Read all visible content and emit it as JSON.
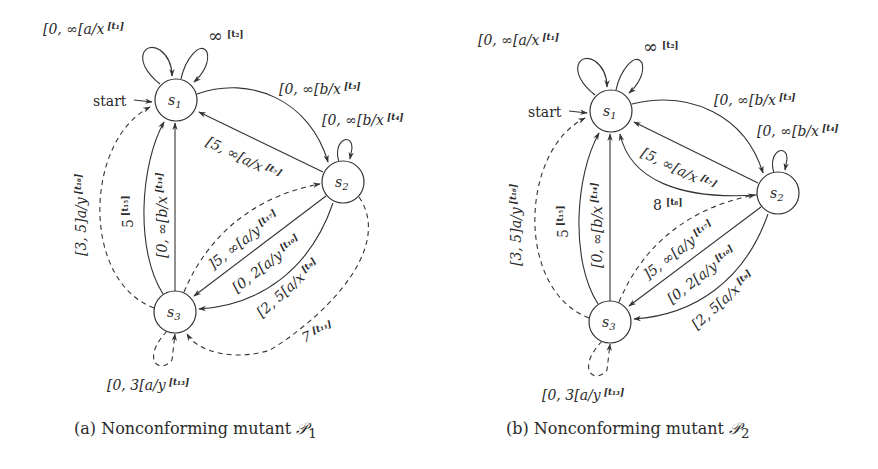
{
  "figures": [
    {
      "id": "a",
      "caption": {
        "prefix": "(a)",
        "text": "Nonconforming mutant",
        "math": "𝒫",
        "subscript": "1"
      },
      "start_label": "start",
      "states": [
        {
          "name": "s",
          "sub": "1"
        },
        {
          "name": "s",
          "sub": "2"
        },
        {
          "name": "s",
          "sub": "3"
        }
      ],
      "transitions": [
        {
          "id": "t1",
          "from": "s1",
          "to": "s1",
          "guard": "[0, ∞[a/x",
          "tag": "[t₁]",
          "style": "solid"
        },
        {
          "id": "t2",
          "from": "s1",
          "to": "s1",
          "guard": "∞",
          "tag": "[t₂]",
          "style": "solid"
        },
        {
          "id": "t3",
          "from": "s1",
          "to": "s2",
          "guard": "[0, ∞[b/x",
          "tag": "[t₃]",
          "style": "solid"
        },
        {
          "id": "t4",
          "from": "s2",
          "to": "s2",
          "guard": "[0, ∞[b/x",
          "tag": "[t₄]",
          "style": "solid"
        },
        {
          "id": "t7",
          "from": "s2",
          "to": "s1",
          "guard": "[5, ∞[a/x",
          "tag": "[t₇]",
          "style": "solid"
        },
        {
          "id": "t9",
          "from": "s2",
          "to": "s3",
          "guard": "[2, 5[a/x",
          "tag": "[t₉]",
          "style": "solid"
        },
        {
          "id": "t10",
          "from": "s2",
          "to": "s3",
          "guard": "[0, 2[a/y",
          "tag": "[t₁₀]",
          "style": "solid"
        },
        {
          "id": "t11",
          "from": "s2",
          "to": "s3",
          "guard": "7",
          "tag": "[t₁₁]",
          "style": "dashed"
        },
        {
          "id": "t13",
          "from": "s3",
          "to": "s3",
          "guard": "[0, 3[a/y",
          "tag": "[t₁₃]",
          "style": "dashed"
        },
        {
          "id": "t14",
          "from": "s3",
          "to": "s1",
          "guard": "[0, ∞[b/x",
          "tag": "[t₁₄]",
          "style": "solid"
        },
        {
          "id": "t15",
          "from": "s3",
          "to": "s1",
          "guard": "5",
          "tag": "[t₁₅]",
          "style": "solid"
        },
        {
          "id": "t16",
          "from": "s3",
          "to": "s1",
          "guard": "[3, 5]a/y",
          "tag": "[t₁₆]",
          "style": "dashed"
        },
        {
          "id": "t17",
          "from": "s3",
          "to": "s2",
          "guard": "]5, ∞[a/y",
          "tag": "[t₁₇]",
          "style": "dashed"
        }
      ]
    },
    {
      "id": "b",
      "caption": {
        "prefix": "(b)",
        "text": "Nonconforming mutant",
        "math": "𝒫",
        "subscript": "2"
      },
      "start_label": "start",
      "states": [
        {
          "name": "s",
          "sub": "1"
        },
        {
          "name": "s",
          "sub": "2"
        },
        {
          "name": "s",
          "sub": "3"
        }
      ],
      "transitions": [
        {
          "id": "t1",
          "from": "s1",
          "to": "s1",
          "guard": "[0, ∞[a/x",
          "tag": "[t₁]",
          "style": "solid"
        },
        {
          "id": "t2",
          "from": "s1",
          "to": "s1",
          "guard": "∞",
          "tag": "[t₂]",
          "style": "solid"
        },
        {
          "id": "t3",
          "from": "s1",
          "to": "s2",
          "guard": "[0, ∞[b/x",
          "tag": "[t₃]",
          "style": "solid"
        },
        {
          "id": "t4",
          "from": "s2",
          "to": "s2",
          "guard": "[0, ∞[b/x",
          "tag": "[t₄]",
          "style": "solid"
        },
        {
          "id": "t7",
          "from": "s2",
          "to": "s1",
          "guard": "[5, ∞[a/x",
          "tag": "[t₇]",
          "style": "solid"
        },
        {
          "id": "t8",
          "from": "s2",
          "to": "s1",
          "guard": "8",
          "tag": "[t₈]",
          "style": "solid"
        },
        {
          "id": "t9",
          "from": "s2",
          "to": "s3",
          "guard": "[2, 5[a/x",
          "tag": "[t₉]",
          "style": "solid"
        },
        {
          "id": "t10",
          "from": "s2",
          "to": "s3",
          "guard": "[0, 2[a/y",
          "tag": "[t₁₀]",
          "style": "solid"
        },
        {
          "id": "t13",
          "from": "s3",
          "to": "s3",
          "guard": "[0, 3[a/y",
          "tag": "[t₁₃]",
          "style": "dashed"
        },
        {
          "id": "t14",
          "from": "s3",
          "to": "s1",
          "guard": "[0, ∞[b/x",
          "tag": "[t₁₄]",
          "style": "solid"
        },
        {
          "id": "t15",
          "from": "s3",
          "to": "s1",
          "guard": "5",
          "tag": "[t₁₅]",
          "style": "solid"
        },
        {
          "id": "t16",
          "from": "s3",
          "to": "s1",
          "guard": "[3, 5]a/y",
          "tag": "[t₁₆]",
          "style": "dashed"
        },
        {
          "id": "t17",
          "from": "s3",
          "to": "s2",
          "guard": "]5, ∞[a/y",
          "tag": "[t₁₇]",
          "style": "dashed"
        }
      ]
    }
  ]
}
